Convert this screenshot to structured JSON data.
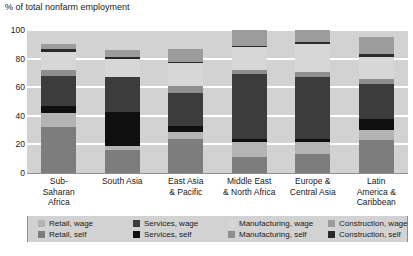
{
  "chart_data": {
    "type": "bar",
    "title": "% of total nonfarm employment",
    "subtitle": "",
    "xlabel": "",
    "ylabel": "% of total nonfarm employment",
    "ylim": [
      0,
      100
    ],
    "yticks": [
      "0",
      "20",
      "40",
      "60",
      "80",
      "100"
    ],
    "grid": true,
    "stacked": true,
    "legend_position": "bottom",
    "categories": [
      "Sub-Saharan Africa",
      "South Asia",
      "East Asia & Pacific",
      "Middle East & North Africa",
      "Europe & Central Asia",
      "Latin America & Caribbean"
    ],
    "series": [
      {
        "name": "Retail, self",
        "color": "#7d7d7d",
        "values": [
          32.0,
          16.0,
          24.0,
          11.0,
          13.0,
          23.0
        ]
      },
      {
        "name": "Retail, wage",
        "color": "#b4b4b4",
        "values": [
          10.0,
          3.0,
          5.0,
          11.0,
          9.0,
          7.0
        ]
      },
      {
        "name": "Services, self",
        "color": "#0f0f0f",
        "values": [
          5.0,
          24.0,
          4.0,
          2.0,
          1.5,
          8.0
        ]
      },
      {
        "name": "Services, wage",
        "color": "#3c3c3c",
        "values": [
          21.0,
          24.0,
          23.0,
          45.0,
          44.0,
          24.0
        ]
      },
      {
        "name": "Manufacturing, self",
        "color": "#8e8e8e",
        "values": [
          4.0,
          0.0,
          5.0,
          3.0,
          3.0,
          4.0
        ]
      },
      {
        "name": "Manufacturing, wage",
        "color": "#d7d7d7",
        "values": [
          13.0,
          13.0,
          16.0,
          16.0,
          20.0,
          15.0
        ]
      },
      {
        "name": "Construction, self",
        "color": "#2a2a2a",
        "values": [
          1.5,
          1.5,
          1.0,
          1.0,
          1.5,
          2.0
        ]
      },
      {
        "name": "Construction, wage",
        "color": "#9c9c9c",
        "values": [
          3.5,
          4.5,
          9.0,
          11.0,
          8.0,
          12.0
        ]
      }
    ]
  },
  "legend": {
    "entries": [
      {
        "label": "Retail, wage",
        "color": "#b4b4b4"
      },
      {
        "label": "Services, wage",
        "color": "#3c3c3c"
      },
      {
        "label": "Manufacturing, wage",
        "color": "#d7d7d7"
      },
      {
        "label": "Construction, wage",
        "color": "#9c9c9c"
      },
      {
        "label": "Retail, self",
        "color": "#7d7d7d"
      },
      {
        "label": "Services, self",
        "color": "#0f0f0f"
      },
      {
        "label": "Manufacturing, self",
        "color": "#8e8e8e"
      },
      {
        "label": "Construction, self",
        "color": "#2a2a2a"
      }
    ]
  },
  "colors": {
    "plot_background": "#d2d2d2",
    "gridline": "#ffffff",
    "axis": "#8e8e8e",
    "text": "#1a1a1a",
    "page_background": "#ffffff"
  },
  "category_label_lines": [
    [
      "Sub-",
      "Saharan",
      "Africa"
    ],
    [
      "South Asia"
    ],
    [
      "East Asia",
      "& Pacific"
    ],
    [
      "Middle East",
      "& North Africa"
    ],
    [
      "Europe &",
      "Central Asia"
    ],
    [
      "Latin",
      "America &",
      "Caribbean"
    ]
  ]
}
